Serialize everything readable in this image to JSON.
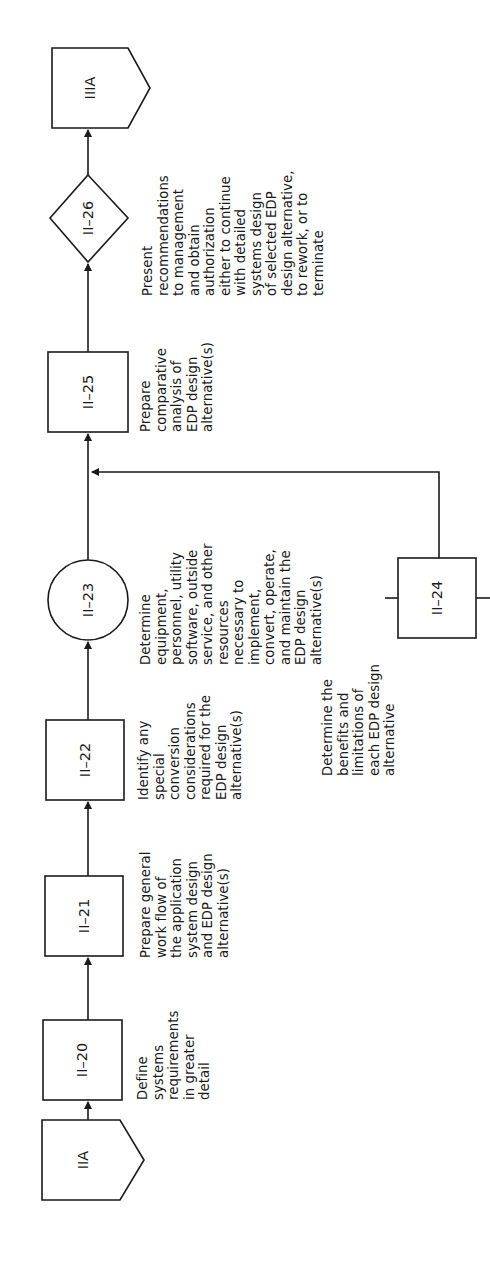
{
  "diagram": {
    "orientation": "rotated-90-ccw",
    "flow_direction": "bottom-to-top",
    "nodes": [
      {
        "id": "IIA",
        "shape": "off-page-connector",
        "label": "IIA"
      },
      {
        "id": "II-20",
        "shape": "process-box",
        "label": "II–20",
        "description": "Define\nsystems\nrequirements\nin greater\ndetail"
      },
      {
        "id": "II-21",
        "shape": "process-box",
        "label": "II–21",
        "description": "Prepare general\nwork flow of\nthe application\nsystem design\nand EDP design\nalternative(s)"
      },
      {
        "id": "II-22",
        "shape": "process-box",
        "label": "II–22",
        "description": "Identify any\nspecial\nconversion\nconsiderations\nrequired for the\nEDP design\nalternative(s)"
      },
      {
        "id": "II-23",
        "shape": "circle",
        "label": "II–23",
        "description": "Determine\nequipment,\npersonnel, utility\nsoftware, outside\nservice, and other\nresources\nnecessary to\nimplement,\nconvert, operate,\nand maintain the\nEDP design\nalternative(s)"
      },
      {
        "id": "II-24",
        "shape": "process-box",
        "label": "II–24",
        "description": "Determine the\nbenefits and\nlimitations of\neach EDP design\nalternative"
      },
      {
        "id": "II-25",
        "shape": "process-box",
        "label": "II–25",
        "description": "Prepare\ncomparative\nanalysis of\nEDP design\nalternative(s)"
      },
      {
        "id": "II-26",
        "shape": "decision-diamond",
        "label": "II–26",
        "description": "Present\nrecommendations\nto management\nand obtain\nauthorization\neither to continue\nwith detailed\nsystems design\nof selected EDP\ndesign alternative,\nto rework, or to\nterminate"
      },
      {
        "id": "IIIA",
        "shape": "off-page-connector",
        "label": "IIIA"
      }
    ],
    "edges": [
      {
        "from": "IIA",
        "to": "II-20"
      },
      {
        "from": "II-20",
        "to": "II-21"
      },
      {
        "from": "II-21",
        "to": "II-22"
      },
      {
        "from": "II-22",
        "to": "II-23"
      },
      {
        "from": "II-23",
        "to": "II-25"
      },
      {
        "from": "II-24",
        "to": "II-25"
      },
      {
        "from": "II-25",
        "to": "II-26"
      },
      {
        "from": "II-26",
        "to": "IIIA"
      }
    ]
  },
  "colors": {
    "ink": "#1a1a1a",
    "paper": "#ffffff"
  }
}
